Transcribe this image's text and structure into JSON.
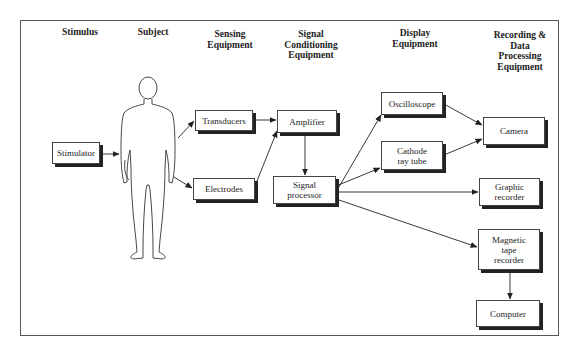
{
  "diagram": {
    "type": "block-diagram",
    "headers": [
      {
        "id": "stimulus",
        "label": "Stimulus"
      },
      {
        "id": "subject",
        "label": "Subject"
      },
      {
        "id": "sensing",
        "label": "Sensing\nEquipment"
      },
      {
        "id": "conditioning",
        "label": "Signal\nConditioning\nEquipment"
      },
      {
        "id": "display",
        "label": "Display\nEquipment"
      },
      {
        "id": "recording",
        "label": "Recording &\nData\nProcessing\nEquipment"
      }
    ],
    "subject_figure": "human-silhouette",
    "nodes": [
      {
        "id": "stimulator",
        "label": "Stimulator"
      },
      {
        "id": "transducers",
        "label": "Transducers"
      },
      {
        "id": "electrodes",
        "label": "Electrodes"
      },
      {
        "id": "amplifier",
        "label": "Amplifier"
      },
      {
        "id": "signal_processor",
        "label": "Signal\nprocessor"
      },
      {
        "id": "oscilloscope",
        "label": "Oscilloscope"
      },
      {
        "id": "crt",
        "label": "Cathode\nray tube"
      },
      {
        "id": "camera",
        "label": "Camera"
      },
      {
        "id": "graphic_recorder",
        "label": "Graphic\nrecorder"
      },
      {
        "id": "tape_recorder",
        "label": "Magnetic\ntape\nrecorder"
      },
      {
        "id": "computer",
        "label": "Computer"
      }
    ],
    "edges": [
      {
        "from": "stimulator",
        "to": "subject"
      },
      {
        "from": "subject",
        "to": "transducers"
      },
      {
        "from": "subject",
        "to": "electrodes"
      },
      {
        "from": "transducers",
        "to": "amplifier"
      },
      {
        "from": "electrodes",
        "to": "amplifier"
      },
      {
        "from": "amplifier",
        "to": "signal_processor"
      },
      {
        "from": "signal_processor",
        "to": "oscilloscope"
      },
      {
        "from": "signal_processor",
        "to": "crt"
      },
      {
        "from": "signal_processor",
        "to": "graphic_recorder"
      },
      {
        "from": "signal_processor",
        "to": "tape_recorder"
      },
      {
        "from": "oscilloscope",
        "to": "camera"
      },
      {
        "from": "crt",
        "to": "camera"
      },
      {
        "from": "tape_recorder",
        "to": "computer"
      }
    ]
  }
}
